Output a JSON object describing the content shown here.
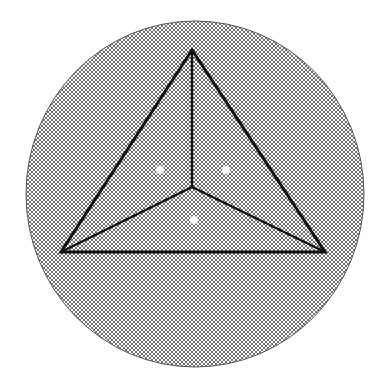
{
  "diagram": {
    "colors": {
      "background": "#ffffff",
      "hatch_fill": "#ffffff",
      "hatch_line": "#6e6e6e",
      "outline": "#111111",
      "dot_fill": "#ffffff"
    },
    "shapes": {
      "region": "circle",
      "outer_polygon": "triangle",
      "sub_regions": 3,
      "dots": 3
    }
  }
}
